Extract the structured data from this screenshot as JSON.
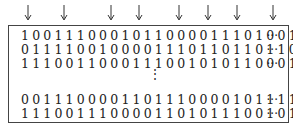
{
  "arrows": {
    "count": 8,
    "icon": "down-arrow-icon"
  },
  "rows": [
    {
      "bits": "10011100010110000111010011",
      "continuation": "···"
    },
    {
      "bits": "01111001000011101101101100",
      "continuation": "···"
    },
    {
      "bits": "11100110001110010101100011",
      "continuation": "···"
    },
    {
      "bits": "00111000011011100001011110",
      "continuation": "···"
    },
    {
      "bits": "11100111000011010111001011",
      "continuation": "···"
    }
  ],
  "vertical_ellipsis": "⋮"
}
